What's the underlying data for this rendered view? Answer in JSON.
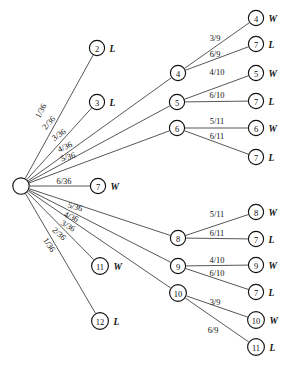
{
  "diagram": {
    "type": "probability-tree",
    "colors": {
      "background": "#ffffff",
      "node_stroke": "#111111",
      "node_fill": "#ffffff",
      "edge_stroke": "#444444",
      "text": "#111111"
    },
    "root": {
      "id": "root",
      "label": "",
      "cx": 21,
      "cy": 186,
      "r": 8.2
    },
    "nodes": [
      {
        "id": "n2",
        "label": "2",
        "cx": 97,
        "cy": 48,
        "r": 7.6,
        "outcome": "L"
      },
      {
        "id": "n3",
        "label": "3",
        "cx": 97,
        "cy": 102,
        "r": 7.6,
        "outcome": "L"
      },
      {
        "id": "n4",
        "label": "4",
        "cx": 178,
        "cy": 73,
        "r": 7.6,
        "outcome": ""
      },
      {
        "id": "n5",
        "label": "5",
        "cx": 177,
        "cy": 102,
        "r": 7.6,
        "outcome": ""
      },
      {
        "id": "n6",
        "label": "6",
        "cx": 177,
        "cy": 128,
        "r": 7.6,
        "outcome": ""
      },
      {
        "id": "n7w",
        "label": "7",
        "cx": 98,
        "cy": 186,
        "r": 7.6,
        "outcome": "W"
      },
      {
        "id": "n8",
        "label": "8",
        "cx": 178,
        "cy": 238,
        "r": 7.6,
        "outcome": ""
      },
      {
        "id": "n9",
        "label": "9",
        "cx": 178,
        "cy": 266,
        "r": 7.6,
        "outcome": ""
      },
      {
        "id": "n10",
        "label": "10",
        "cx": 178,
        "cy": 293,
        "r": 8.4,
        "outcome": ""
      },
      {
        "id": "n11w",
        "label": "11",
        "cx": 100,
        "cy": 266,
        "r": 8.4,
        "outcome": "W"
      },
      {
        "id": "n12",
        "label": "12",
        "cx": 100,
        "cy": 321,
        "r": 8.4,
        "outcome": "L"
      },
      {
        "id": "l4w",
        "label": "4",
        "cx": 256,
        "cy": 18,
        "r": 7.6,
        "outcome": "W"
      },
      {
        "id": "l7a",
        "label": "7",
        "cx": 256,
        "cy": 44,
        "r": 7.6,
        "outcome": "L"
      },
      {
        "id": "l5w",
        "label": "5",
        "cx": 256,
        "cy": 73,
        "r": 7.6,
        "outcome": "W"
      },
      {
        "id": "l7b",
        "label": "7",
        "cx": 256,
        "cy": 101,
        "r": 7.6,
        "outcome": "L"
      },
      {
        "id": "l6w",
        "label": "6",
        "cx": 256,
        "cy": 128,
        "r": 7.6,
        "outcome": "W"
      },
      {
        "id": "l7c",
        "label": "7",
        "cx": 256,
        "cy": 157,
        "r": 7.6,
        "outcome": "L"
      },
      {
        "id": "l8w",
        "label": "8",
        "cx": 256,
        "cy": 212,
        "r": 7.6,
        "outcome": "W"
      },
      {
        "id": "l7d",
        "label": "7",
        "cx": 256,
        "cy": 239,
        "r": 7.6,
        "outcome": "L"
      },
      {
        "id": "l9w",
        "label": "9",
        "cx": 256,
        "cy": 265,
        "r": 7.6,
        "outcome": "W"
      },
      {
        "id": "l7e",
        "label": "7",
        "cx": 256,
        "cy": 292,
        "r": 7.6,
        "outcome": "L"
      },
      {
        "id": "l10w",
        "label": "10",
        "cx": 256,
        "cy": 320,
        "r": 8.4,
        "outcome": "W"
      },
      {
        "id": "l11l",
        "label": "11",
        "cx": 256,
        "cy": 347,
        "r": 8.4,
        "outcome": "L"
      }
    ],
    "edges": [
      {
        "id": "e-root-2",
        "from": "root",
        "to": "n2",
        "label": "1/36",
        "lx": 41,
        "ly": 111,
        "rot": -62
      },
      {
        "id": "e-root-3",
        "from": "root",
        "to": "n3",
        "label": "2/36",
        "lx": 49,
        "ly": 123,
        "rot": -48
      },
      {
        "id": "e-root-4",
        "from": "root",
        "to": "n4",
        "label": "3/36",
        "lx": 59,
        "ly": 135,
        "rot": -34
      },
      {
        "id": "e-root-5",
        "from": "root",
        "to": "n5",
        "label": "4/36",
        "lx": 65,
        "ly": 147,
        "rot": -25
      },
      {
        "id": "e-root-6",
        "from": "root",
        "to": "n6",
        "label": "5/36",
        "lx": 68,
        "ly": 157,
        "rot": -16
      },
      {
        "id": "e-root-7",
        "from": "root",
        "to": "n7w",
        "label": "6/36",
        "lx": 64,
        "ly": 181,
        "rot": 0
      },
      {
        "id": "e-root-8",
        "from": "root",
        "to": "n8",
        "label": "5/36",
        "lx": 75,
        "ly": 207,
        "rot": 16
      },
      {
        "id": "e-root-9",
        "from": "root",
        "to": "n9",
        "label": "4/36",
        "lx": 71,
        "ly": 217,
        "rot": 24
      },
      {
        "id": "e-root-10",
        "from": "root",
        "to": "n10",
        "label": "3/36",
        "lx": 68,
        "ly": 226,
        "rot": 31
      },
      {
        "id": "e-root-11",
        "from": "root",
        "to": "n11w",
        "label": "2/36",
        "lx": 59,
        "ly": 234,
        "rot": 43
      },
      {
        "id": "e-root-12",
        "from": "root",
        "to": "n12",
        "label": "1/36",
        "lx": 49,
        "ly": 245,
        "rot": 57
      },
      {
        "id": "e-4-4w",
        "from": "n4",
        "to": "l4w",
        "label": "3/9",
        "lx": 215,
        "ly": 38,
        "rot": 0
      },
      {
        "id": "e-4-7",
        "from": "n4",
        "to": "l7a",
        "label": "6/9",
        "lx": 215,
        "ly": 54,
        "rot": 0
      },
      {
        "id": "e-5-5w",
        "from": "n5",
        "to": "l5w",
        "label": "4/10",
        "lx": 217,
        "ly": 72,
        "rot": 0
      },
      {
        "id": "e-5-7",
        "from": "n5",
        "to": "l7b",
        "label": "6/10",
        "lx": 217,
        "ly": 95,
        "rot": 0
      },
      {
        "id": "e-6-6w",
        "from": "n6",
        "to": "l6w",
        "label": "5/11",
        "lx": 217,
        "ly": 121,
        "rot": 0
      },
      {
        "id": "e-6-7",
        "from": "n6",
        "to": "l7c",
        "label": "6/11",
        "lx": 217,
        "ly": 136,
        "rot": 0
      },
      {
        "id": "e-8-8w",
        "from": "n8",
        "to": "l8w",
        "label": "5/11",
        "lx": 217,
        "ly": 214,
        "rot": 0
      },
      {
        "id": "e-8-7",
        "from": "n8",
        "to": "l7d",
        "label": "6/11",
        "lx": 217,
        "ly": 233,
        "rot": 0
      },
      {
        "id": "e-9-9w",
        "from": "n9",
        "to": "l9w",
        "label": "4/10",
        "lx": 217,
        "ly": 260,
        "rot": 0
      },
      {
        "id": "e-9-7",
        "from": "n9",
        "to": "l7e",
        "label": "6/10",
        "lx": 217,
        "ly": 273,
        "rot": 0
      },
      {
        "id": "e-10-10w",
        "from": "n10",
        "to": "l10w",
        "label": "3/9",
        "lx": 215,
        "ly": 302,
        "rot": 0
      },
      {
        "id": "e-10-11l",
        "from": "n10",
        "to": "l11l",
        "label": "6/9",
        "lx": 213,
        "ly": 330,
        "rot": 0
      }
    ]
  }
}
